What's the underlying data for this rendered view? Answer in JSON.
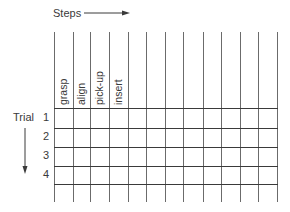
{
  "header": {
    "steps_label": "Steps",
    "trial_label": "Trial"
  },
  "steps": [
    "grasp",
    "align",
    "pick-up",
    "insert"
  ],
  "trials": [
    "1",
    "2",
    "3",
    "4"
  ],
  "grid": {
    "columns": 13,
    "column_x": [
      54,
      73,
      90,
      109,
      128,
      146,
      165,
      183,
      203,
      221,
      240,
      258,
      277
    ],
    "row_y": [
      108,
      128,
      147,
      166,
      184
    ],
    "top": 32,
    "bottom": 202,
    "left": 54,
    "right": 277
  },
  "colors": {
    "vertical_line": "#6b6b6b",
    "horizontal_line": "#3a3a3a",
    "text": "#3a3a3a"
  }
}
